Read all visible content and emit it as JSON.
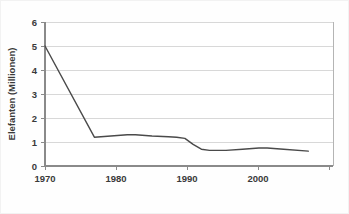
{
  "chart_data": {
    "type": "line",
    "title": "",
    "subtitle": "",
    "xlabel": "",
    "ylabel": "Elefanten (Millionen)",
    "xlim": [
      1970,
      2005
    ],
    "ylim": [
      0,
      6
    ],
    "grid": true,
    "legend": null,
    "legend_position": "none",
    "xticks": [
      1970,
      1980,
      1990,
      2000
    ],
    "xticklabels": [
      "1970",
      "1980",
      "1990",
      "2000"
    ],
    "yticks": [
      0,
      1,
      2,
      3,
      4,
      5,
      6
    ],
    "yticklabels": [
      "0",
      "1",
      "2",
      "3",
      "4",
      "5",
      "6"
    ],
    "series": [
      {
        "name": "Elefanten",
        "color": "#4a4a4a",
        "x": [
          1970,
          1976,
          1978,
          1980,
          1981,
          1983,
          1985,
          1986,
          1987,
          1988,
          1989,
          1990,
          1992,
          1994,
          1996,
          1997,
          1999,
          2002
        ],
        "values": [
          5.0,
          1.2,
          1.25,
          1.3,
          1.3,
          1.25,
          1.22,
          1.2,
          1.15,
          0.9,
          0.7,
          0.65,
          0.65,
          0.7,
          0.75,
          0.75,
          0.7,
          0.62
        ]
      }
    ]
  },
  "axes": {
    "y_axis_title": "Elefanten (Millionen)"
  }
}
